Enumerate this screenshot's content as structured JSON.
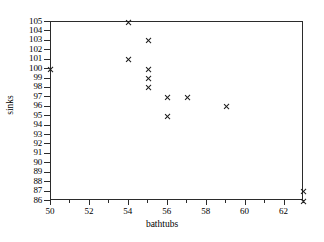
{
  "chart_data": {
    "type": "scatter",
    "title": "",
    "xlabel": "bathtubs",
    "ylabel": "sinks",
    "xlim": [
      50,
      63
    ],
    "ylim": [
      86,
      105
    ],
    "grid": false,
    "legend": null,
    "marker": "x",
    "marker_color": "#1a1a1a",
    "x_ticks_major": [
      50,
      52,
      54,
      56,
      58,
      60,
      62
    ],
    "x_ticks_minor": [
      51,
      53,
      55,
      57,
      59,
      61,
      63
    ],
    "y_ticks": [
      86,
      87,
      88,
      89,
      90,
      91,
      92,
      93,
      94,
      95,
      96,
      97,
      98,
      99,
      100,
      101,
      102,
      103,
      104,
      105
    ],
    "points": [
      {
        "x": 50,
        "y": 100
      },
      {
        "x": 54,
        "y": 105
      },
      {
        "x": 54,
        "y": 101
      },
      {
        "x": 55,
        "y": 103
      },
      {
        "x": 55,
        "y": 100
      },
      {
        "x": 55,
        "y": 99
      },
      {
        "x": 55,
        "y": 98
      },
      {
        "x": 56,
        "y": 97
      },
      {
        "x": 56,
        "y": 95
      },
      {
        "x": 57,
        "y": 97
      },
      {
        "x": 59,
        "y": 96
      },
      {
        "x": 63,
        "y": 87
      },
      {
        "x": 63,
        "y": 86
      }
    ]
  }
}
